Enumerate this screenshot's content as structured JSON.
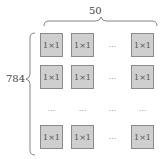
{
  "top_label": "50",
  "left_label": "784",
  "cell": "1×1",
  "ellipsis": "...",
  "colors": {
    "cell_fill": "#cfcfcf",
    "cell_border": "#8a8a8a",
    "brace": "#666666"
  }
}
